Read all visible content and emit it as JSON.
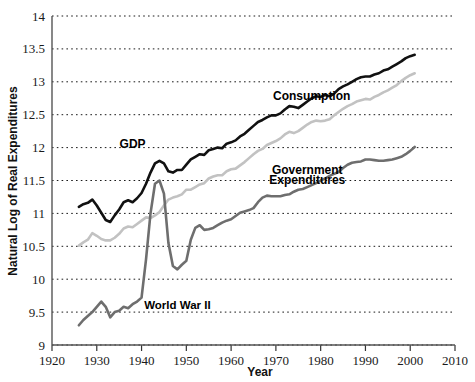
{
  "chart_data": {
    "type": "line",
    "title": "",
    "xlabel": "Year",
    "ylabel": "Natural Log of Real Expenditures",
    "xlim": [
      1920,
      2010
    ],
    "ylim": [
      9,
      14
    ],
    "grid": true,
    "legend_position": "inline-labels",
    "xticks": [
      "1920",
      "1930",
      "1940",
      "1950",
      "1960",
      "1970",
      "1980",
      "1990",
      "2000",
      "2010"
    ],
    "yticks": [
      "9",
      "9.5",
      "10",
      "10.5",
      "11",
      "11.5",
      "12",
      "12.5",
      "13",
      "13.5",
      "14"
    ],
    "annotations": [
      {
        "text": "World War II",
        "x": 1948,
        "y": 9.54
      },
      {
        "text": "GDP",
        "x": 1938,
        "y": 12.0
      },
      {
        "text": "Consumption",
        "x": 1978,
        "y": 12.72
      },
      {
        "text": "Government",
        "x": 1977,
        "y": 11.6
      },
      {
        "text": "Expenditures",
        "x": 1977,
        "y": 11.44
      }
    ],
    "series": [
      {
        "name": "GDP",
        "color": "#111111",
        "label": "GDP",
        "width": 2.6,
        "x": [
          1926,
          1927,
          1928,
          1929,
          1930,
          1931,
          1932,
          1933,
          1934,
          1935,
          1936,
          1937,
          1938,
          1939,
          1940,
          1941,
          1942,
          1943,
          1944,
          1945,
          1946,
          1947,
          1948,
          1949,
          1950,
          1951,
          1952,
          1953,
          1954,
          1955,
          1956,
          1957,
          1958,
          1959,
          1960,
          1961,
          1962,
          1963,
          1964,
          1965,
          1966,
          1967,
          1968,
          1969,
          1970,
          1971,
          1972,
          1973,
          1974,
          1975,
          1976,
          1977,
          1978,
          1979,
          1980,
          1981,
          1982,
          1983,
          1984,
          1985,
          1986,
          1987,
          1988,
          1989,
          1990,
          1991,
          1992,
          1993,
          1994,
          1995,
          1996,
          1997,
          1998,
          1999,
          2000,
          2001
        ],
        "y": [
          11.1,
          11.14,
          11.16,
          11.21,
          11.12,
          11.01,
          10.9,
          10.87,
          10.97,
          11.06,
          11.17,
          11.2,
          11.17,
          11.23,
          11.31,
          11.45,
          11.62,
          11.76,
          11.8,
          11.76,
          11.64,
          11.62,
          11.66,
          11.66,
          11.74,
          11.82,
          11.86,
          11.9,
          11.89,
          11.96,
          11.98,
          12.0,
          11.99,
          12.06,
          12.08,
          12.11,
          12.17,
          12.21,
          12.27,
          12.33,
          12.39,
          12.42,
          12.46,
          12.49,
          12.49,
          12.52,
          12.58,
          12.63,
          12.62,
          12.6,
          12.65,
          12.7,
          12.75,
          12.78,
          12.77,
          12.8,
          12.78,
          12.82,
          12.89,
          12.93,
          12.96,
          13.0,
          13.04,
          13.07,
          13.08,
          13.08,
          13.11,
          13.13,
          13.17,
          13.19,
          13.23,
          13.27,
          13.31,
          13.36,
          13.39,
          13.41
        ]
      },
      {
        "name": "Consumption",
        "color": "#c2c2c2",
        "label": "Consumption",
        "width": 2.6,
        "x": [
          1926,
          1927,
          1928,
          1929,
          1930,
          1931,
          1932,
          1933,
          1934,
          1935,
          1936,
          1937,
          1938,
          1939,
          1940,
          1941,
          1942,
          1943,
          1944,
          1945,
          1946,
          1947,
          1948,
          1949,
          1950,
          1951,
          1952,
          1953,
          1954,
          1955,
          1956,
          1957,
          1958,
          1959,
          1960,
          1961,
          1962,
          1963,
          1964,
          1965,
          1966,
          1967,
          1968,
          1969,
          1970,
          1971,
          1972,
          1973,
          1974,
          1975,
          1976,
          1977,
          1978,
          1979,
          1980,
          1981,
          1982,
          1983,
          1984,
          1985,
          1986,
          1987,
          1988,
          1989,
          1990,
          1991,
          1992,
          1993,
          1994,
          1995,
          1996,
          1997,
          1998,
          1999,
          2000,
          2001
        ],
        "y": [
          10.51,
          10.56,
          10.6,
          10.7,
          10.66,
          10.61,
          10.59,
          10.59,
          10.63,
          10.69,
          10.77,
          10.8,
          10.79,
          10.84,
          10.89,
          10.94,
          10.93,
          10.97,
          11.02,
          11.12,
          11.21,
          11.24,
          11.26,
          11.29,
          11.36,
          11.36,
          11.4,
          11.44,
          11.46,
          11.53,
          11.56,
          11.58,
          11.58,
          11.64,
          11.67,
          11.68,
          11.73,
          11.78,
          11.84,
          11.9,
          11.95,
          11.98,
          12.04,
          12.07,
          12.1,
          12.14,
          12.2,
          12.24,
          12.22,
          12.25,
          12.3,
          12.35,
          12.39,
          12.41,
          12.4,
          12.41,
          12.43,
          12.49,
          12.54,
          12.59,
          12.63,
          12.66,
          12.7,
          12.72,
          12.74,
          12.73,
          12.77,
          12.8,
          12.84,
          12.87,
          12.91,
          12.95,
          13.01,
          13.06,
          13.1,
          13.13
        ]
      },
      {
        "name": "Government Expenditures",
        "color": "#6e6e6e",
        "label": "Government Expenditures",
        "width": 2.6,
        "x": [
          1926,
          1927,
          1928,
          1929,
          1930,
          1931,
          1932,
          1933,
          1934,
          1935,
          1936,
          1937,
          1938,
          1939,
          1940,
          1941,
          1942,
          1943,
          1944,
          1945,
          1946,
          1947,
          1948,
          1949,
          1950,
          1951,
          1952,
          1953,
          1954,
          1955,
          1956,
          1957,
          1958,
          1959,
          1960,
          1961,
          1962,
          1963,
          1964,
          1965,
          1966,
          1967,
          1968,
          1969,
          1970,
          1971,
          1972,
          1973,
          1974,
          1975,
          1976,
          1977,
          1978,
          1979,
          1980,
          1981,
          1982,
          1983,
          1984,
          1985,
          1986,
          1987,
          1988,
          1989,
          1990,
          1991,
          1992,
          1993,
          1994,
          1995,
          1996,
          1997,
          1998,
          1999,
          2000,
          2001
        ],
        "y": [
          9.3,
          9.38,
          9.44,
          9.5,
          9.58,
          9.66,
          9.58,
          9.42,
          9.5,
          9.52,
          9.58,
          9.56,
          9.62,
          9.66,
          9.72,
          10.3,
          11.0,
          11.45,
          11.5,
          11.3,
          10.55,
          10.2,
          10.15,
          10.22,
          10.28,
          10.6,
          10.78,
          10.82,
          10.75,
          10.76,
          10.78,
          10.82,
          10.86,
          10.89,
          10.91,
          10.96,
          11.01,
          11.03,
          11.05,
          11.08,
          11.17,
          11.24,
          11.27,
          11.26,
          11.26,
          11.26,
          11.28,
          11.29,
          11.33,
          11.36,
          11.37,
          11.4,
          11.43,
          11.46,
          11.5,
          11.53,
          11.57,
          11.6,
          11.63,
          11.69,
          11.74,
          11.77,
          11.78,
          11.79,
          11.82,
          11.82,
          11.81,
          11.8,
          11.8,
          11.81,
          11.82,
          11.84,
          11.86,
          11.9,
          11.95,
          12.01
        ]
      }
    ]
  }
}
